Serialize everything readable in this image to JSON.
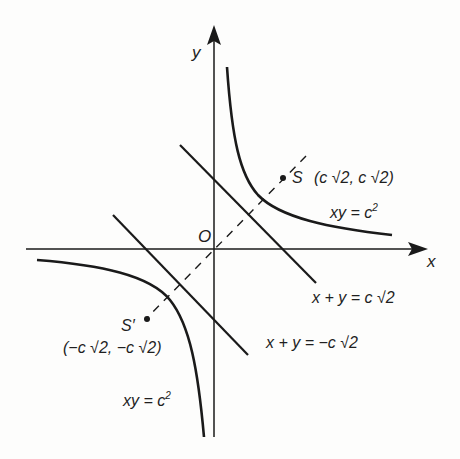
{
  "figure": {
    "axes": {
      "x_label": "x",
      "y_label": "y",
      "origin_label": "O"
    },
    "curves": [
      {
        "name": "hyperbola-branch-first-quadrant",
        "equation_lhs": "xy = c",
        "equation_exp": "2"
      },
      {
        "name": "hyperbola-branch-third-quadrant",
        "equation_lhs": "xy = c",
        "equation_exp": "2"
      }
    ],
    "lines": [
      {
        "name": "tangent-upper",
        "equation": "x + y = c √2"
      },
      {
        "name": "tangent-lower",
        "equation": "x + y = −c √2"
      }
    ],
    "points": {
      "S": {
        "label": "S",
        "coords": "(c √2, c √2)"
      },
      "S_prime": {
        "label": "S′",
        "coords": "(−c √2, −c √2)"
      }
    },
    "colors": {
      "ink": "#1a1a1a",
      "background": "#fdfdfc"
    }
  }
}
